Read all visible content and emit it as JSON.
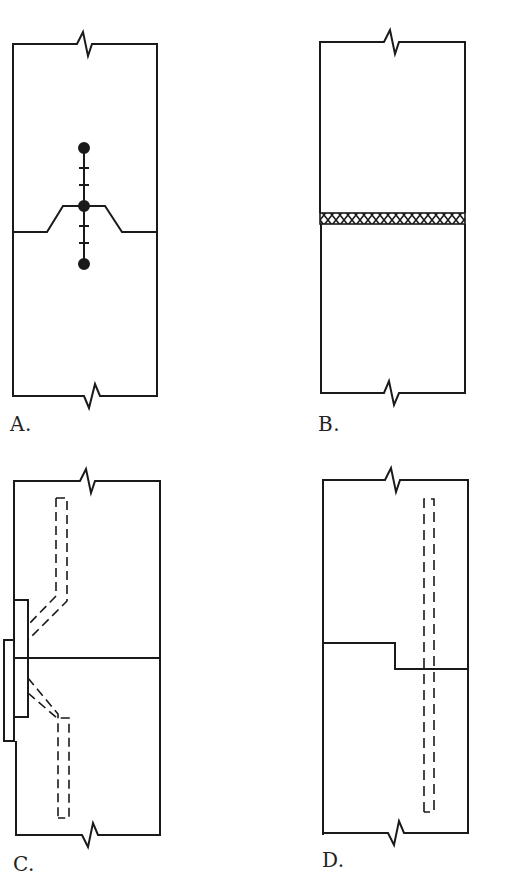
{
  "panels": [
    {
      "id": "A",
      "label": "A.",
      "description": "Stepped joint connected by a line of bolts/rivets",
      "features": {
        "joint": "raised trapezoidal step",
        "fasteners": "vertical line with 3 dots and 4 tick marks",
        "break_symbols": [
          "top",
          "bottom"
        ]
      }
    },
    {
      "id": "B",
      "label": "B.",
      "description": "Straight joint filled with cross-hatched weld/adhesive band",
      "features": {
        "joint": "horizontal band with crosshatch",
        "break_symbols": [
          "top",
          "bottom"
        ]
      }
    },
    {
      "id": "C",
      "label": "C.",
      "description": "Straight butt joint with external side plates and dashed bent reinforcement",
      "features": {
        "joint": "straight horizontal line",
        "plates": [
          "inner plate",
          "outer plate"
        ],
        "hidden_lines": "dashed bent reinforcing bars above and below joint",
        "break_symbols": [
          "top",
          "bottom"
        ]
      }
    },
    {
      "id": "D",
      "label": "D.",
      "description": "Stepped joint with continuous dashed vertical reinforcement",
      "features": {
        "joint": "single step down to the right",
        "hidden_lines": "long dashed vertical bar crossing joint",
        "break_symbols": [
          "top",
          "bottom"
        ]
      }
    }
  ],
  "colors": {
    "line": "#1a1a1a",
    "background": "#ffffff"
  }
}
